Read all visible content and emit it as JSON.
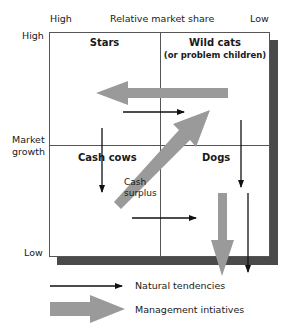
{
  "diagram": {
    "type": "growth-share matrix",
    "x_axis": {
      "label": "Relative market share",
      "high": "High",
      "low": "Low"
    },
    "y_axis": {
      "label_line1": "Market",
      "label_line2": "growth",
      "high": "High",
      "low": "Low"
    },
    "quadrants": {
      "top_left": {
        "title": "Stars"
      },
      "top_right": {
        "title": "Wild cats",
        "subtitle": "(or problem children)"
      },
      "bottom_left": {
        "title": "Cash cows"
      },
      "bottom_right": {
        "title": "Dogs"
      }
    },
    "annotations": {
      "cash_surplus_line1": "Cash",
      "cash_surplus_line2": "surplus"
    },
    "legend": {
      "natural": "Natural tendencies",
      "management": "Management intiatives"
    },
    "colors": {
      "frame": "#555555",
      "shadow": "#4a4a4a",
      "thin_arrow": "#111111",
      "thick_arrow": "#9a9a9a"
    }
  }
}
